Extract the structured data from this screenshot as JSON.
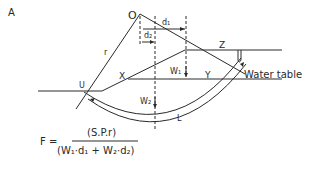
{
  "figure": {
    "panel_label": "A",
    "labels": {
      "center": "O",
      "radius": "r",
      "d1": "d₁",
      "d2": "d₂",
      "point_x": "X",
      "point_y": "Y",
      "point_z": "Z",
      "point_u": "U",
      "w1": "W₁",
      "w2": "W₂",
      "arc_length": "L",
      "water_table": "Water table"
    }
  },
  "formula": {
    "lhs": "F =",
    "numerator": "(S.P.r)",
    "denominator": "(W₁·d₁ + W₂·d₂)"
  }
}
